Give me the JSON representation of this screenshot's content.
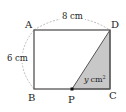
{
  "diagram": {
    "type": "geometry-rectangle",
    "points": {
      "A": {
        "label": "A",
        "x": 34,
        "y": 30
      },
      "D": {
        "label": "D",
        "x": 110,
        "y": 30
      },
      "B": {
        "label": "B",
        "x": 34,
        "y": 89
      },
      "C": {
        "label": "C",
        "x": 110,
        "y": 89
      },
      "P": {
        "label": "P",
        "x": 72,
        "y": 89
      }
    },
    "dimensions": {
      "top": "8 cm",
      "left": "6 cm"
    },
    "shaded_region": {
      "vertices": [
        "P",
        "D",
        "C"
      ],
      "label_var": "y",
      "label_unit": "cm",
      "label_exp": "2",
      "fill": "#c8c8c8"
    },
    "colors": {
      "stroke": "#555555",
      "dashed": "#aaaaaa",
      "text": "#222222"
    }
  }
}
